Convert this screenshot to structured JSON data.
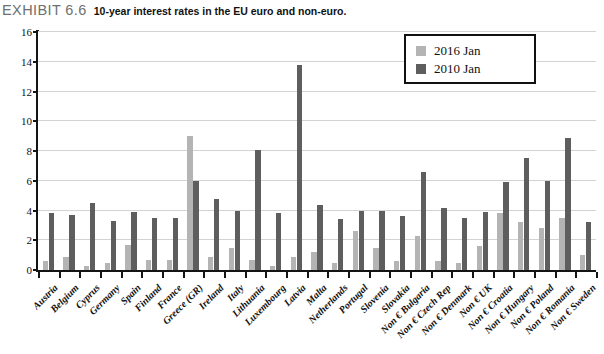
{
  "exhibit": {
    "label": "EXHIBIT 6.6",
    "caption": "10-year interest rates in the EU euro and non-euro."
  },
  "colors": {
    "series_2016": "#b4b4b4",
    "series_2010": "#5e5e5e",
    "axis": "#141414",
    "gridline": "#d3d3d3",
    "background": "#ffffff"
  },
  "legend": {
    "position": "top-right",
    "items": [
      {
        "label": "2016 Jan",
        "color": "#b4b4b4"
      },
      {
        "label": "2010 Jan",
        "color": "#5e5e5e"
      }
    ]
  },
  "chart_data": {
    "type": "bar",
    "title": "10-year interest rates in the EU euro and non-euro.",
    "xlabel": "",
    "ylabel": "",
    "ylim": [
      0,
      16
    ],
    "yticks": [
      0,
      2,
      4,
      6,
      8,
      10,
      12,
      14,
      16
    ],
    "ytick_labels": [
      "0",
      "2",
      "4",
      "6",
      "8",
      "10",
      "12",
      "14",
      "16"
    ],
    "grid": true,
    "categories": [
      "Austria",
      "Belgium",
      "Cyprus",
      "Germany",
      "Spain",
      "Finland",
      "France",
      "Greece (GR)",
      "Ireland",
      "Italy",
      "Lithuania",
      "Luxembourg",
      "Latvia",
      "Malta",
      "Netherlands",
      "Portugal",
      "Slovenia",
      "Slovakia",
      "Non € Bulgaria",
      "Non € Czech Rep",
      "Non € Denmark",
      "Non € UK",
      "Non € Croatia",
      "Non € Hungary",
      "Non € Poland",
      "Non € Romania",
      "Non € Sweden"
    ],
    "series": [
      {
        "name": "2016 Jan",
        "color": "#b4b4b4",
        "values": [
          0.6,
          0.9,
          0.3,
          0.5,
          1.7,
          0.7,
          0.7,
          9.0,
          0.9,
          1.5,
          0.7,
          0.3,
          0.9,
          1.2,
          0.5,
          2.6,
          1.5,
          0.6,
          2.3,
          0.6,
          0.5,
          1.6,
          3.8,
          3.2,
          2.8,
          3.5,
          1.0
        ],
        "unit": "percent"
      },
      {
        "name": "2010 Jan",
        "color": "#5e5e5e",
        "values": [
          3.8,
          3.7,
          4.5,
          3.3,
          3.9,
          3.5,
          3.5,
          6.0,
          4.8,
          4.0,
          8.1,
          3.8,
          13.8,
          4.4,
          3.4,
          4.0,
          4.0,
          3.6,
          6.6,
          4.2,
          3.5,
          3.9,
          5.9,
          7.5,
          6.0,
          8.9,
          3.2
        ],
        "unit": "percent"
      }
    ]
  }
}
